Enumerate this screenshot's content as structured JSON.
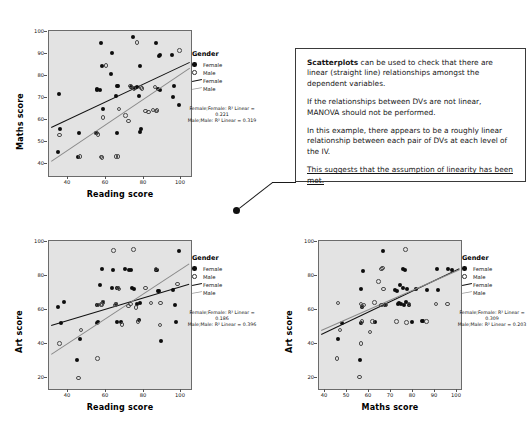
{
  "page": {
    "background": "#ffffff"
  },
  "colors": {
    "plot_background": "#e3e3e3",
    "plot_border": "#6b6b6b",
    "female_marker": "#0d0d0d",
    "male_marker": "#4a4a4a",
    "female_line": "#111111",
    "male_line": "#8a8a8a",
    "textbox_border": "#3a3a3a"
  },
  "legend": {
    "title": "Gender",
    "items": [
      {
        "label": "Female",
        "key": "filled-circle"
      },
      {
        "label": "Male",
        "key": "open-circle"
      },
      {
        "label": "Female",
        "key": "solid-line"
      },
      {
        "label": "Male",
        "key": "thin-line"
      }
    ]
  },
  "textbox": {
    "paragraphs": [
      {
        "bold_lead": "Scatterplots",
        "rest": " can be used to check that there are linear (straight line) relationships amongst the dependent variables."
      },
      {
        "bold_lead": "",
        "rest": "If the relationships between DVs are not linear, MANOVA should not be performed."
      },
      {
        "bold_lead": "",
        "rest": "In this example, there appears to be a roughly linear relationship between each pair of DVs at each level of the IV."
      }
    ],
    "underlined_paragraph": "This suggests that the assumption of linearity has been met."
  },
  "chart_data": [
    {
      "id": "maths-vs-reading",
      "type": "scatter",
      "title": "",
      "xlabel": "Reading score",
      "ylabel": "Maths score",
      "xlim": [
        30,
        105
      ],
      "ylim": [
        36,
        103
      ],
      "xticks": [
        40,
        60,
        80,
        100
      ],
      "yticks": [
        40,
        50,
        60,
        70,
        80,
        90,
        100
      ],
      "grid": false,
      "legend_position": "right",
      "r_squared_text": "Female;Female: R² Linear = 0.221\nMale;Male: R² Linear = 0.319",
      "series": [
        {
          "name": "Female",
          "marker": "filled-circle",
          "r_squared": 0.221,
          "fit": {
            "x1": 31,
            "y1": 58.6,
            "x2": 104,
            "y2": 88.6
          },
          "points": [
            [
              35.5,
              74.0
            ],
            [
              36.0,
              57.8
            ],
            [
              35.0,
              47.2
            ],
            [
              45.5,
              45.0
            ],
            [
              46.0,
              55.8
            ],
            [
              55.5,
              76.0
            ],
            [
              55.0,
              55.8
            ],
            [
              57.5,
              97.6
            ],
            [
              58.0,
              87.0
            ],
            [
              55.5,
              75.6
            ],
            [
              58.5,
              66.8
            ],
            [
              63.5,
              93.0
            ],
            [
              63.0,
              83.0
            ],
            [
              65.5,
              73.0
            ],
            [
              66.0,
              55.8
            ],
            [
              66.5,
              77.8
            ],
            [
              74.5,
              100.0
            ],
            [
              73.5,
              77.0
            ],
            [
              75.5,
              76.8
            ],
            [
              76.5,
              77.2
            ],
            [
              77.5,
              73.0
            ],
            [
              78.0,
              87.0
            ],
            [
              78.5,
              57.8
            ],
            [
              78.0,
              56.2
            ],
            [
              86.5,
              97.5
            ],
            [
              88.0,
              91.5
            ],
            [
              88.5,
              91.8
            ],
            [
              87.5,
              76.0
            ],
            [
              88.5,
              75.8
            ],
            [
              95.0,
              92.0
            ],
            [
              95.5,
              72.5
            ],
            [
              96.0,
              77.8
            ],
            [
              98.5,
              69.0
            ],
            [
              66.0,
              77.5
            ],
            [
              57.0,
              75.8
            ]
          ]
        },
        {
          "name": "Male",
          "marker": "open-circle",
          "r_squared": 0.319,
          "fit": {
            "x1": 31,
            "y1": 43.0,
            "x2": 104,
            "y2": 86.0
          },
          "points": [
            [
              35.5,
              55.0
            ],
            [
              46.5,
              45.0
            ],
            [
              55.0,
              55.8
            ],
            [
              56.0,
              55.2
            ],
            [
              57.5,
              44.8
            ],
            [
              58.0,
              44.6
            ],
            [
              58.5,
              63.0
            ],
            [
              60.0,
              87.0
            ],
            [
              65.5,
              45.0
            ],
            [
              66.5,
              45.0
            ],
            [
              67.0,
              67.0
            ],
            [
              70.5,
              64.0
            ],
            [
              72.0,
              61.5
            ],
            [
              76.5,
              97.6
            ],
            [
              78.5,
              77.0
            ],
            [
              79.0,
              76.5
            ],
            [
              81.0,
              66.0
            ],
            [
              82.5,
              65.5
            ],
            [
              85.0,
              66.5
            ],
            [
              86.0,
              77.2
            ],
            [
              99.0,
              94.0
            ],
            [
              86.5,
              66.0
            ],
            [
              87.0,
              66.2
            ],
            [
              75.0,
              76.5
            ],
            [
              73.0,
              77.5
            ]
          ]
        }
      ]
    },
    {
      "id": "art-vs-reading",
      "type": "scatter",
      "title": "",
      "xlabel": "Reading score",
      "ylabel": "Art score",
      "xlim": [
        30,
        105
      ],
      "ylim": [
        16,
        104
      ],
      "xticks": [
        40,
        60,
        80,
        100
      ],
      "yticks": [
        20,
        40,
        60,
        80,
        100
      ],
      "grid": false,
      "legend_position": "right",
      "r_squared_text": "Female;Female: R² Linear = 0.186\nMale;Male: R² Linear = 0.396",
      "series": [
        {
          "name": "Female",
          "marker": "filled-circle",
          "r_squared": 0.186,
          "fit": {
            "x1": 31,
            "y1": 54.0,
            "x2": 104,
            "y2": 78.5
          },
          "points": [
            [
              35.0,
              65.0
            ],
            [
              36.5,
              55.0
            ],
            [
              38.0,
              67.5
            ],
            [
              45.0,
              33.0
            ],
            [
              46.5,
              45.5
            ],
            [
              55.5,
              66.0
            ],
            [
              56.0,
              55.8
            ],
            [
              55.5,
              55.5
            ],
            [
              57.0,
              78.0
            ],
            [
              58.5,
              68.0
            ],
            [
              58.0,
              87.5
            ],
            [
              64.0,
              87.0
            ],
            [
              65.5,
              66.8
            ],
            [
              66.0,
              75.8
            ],
            [
              66.5,
              76.0
            ],
            [
              68.0,
              55.8
            ],
            [
              70.0,
              87.5
            ],
            [
              72.0,
              87.0
            ],
            [
              73.5,
              86.5
            ],
            [
              74.0,
              76.0
            ],
            [
              75.0,
              75.5
            ],
            [
              76.5,
              66.8
            ],
            [
              77.5,
              57.0
            ],
            [
              78.0,
              67.0
            ],
            [
              86.5,
              87.0
            ],
            [
              87.0,
              86.5
            ],
            [
              87.5,
              74.5
            ],
            [
              88.0,
              74.0
            ],
            [
              89.0,
              44.5
            ],
            [
              95.5,
              75.0
            ],
            [
              96.5,
              66.0
            ],
            [
              98.5,
              98.0
            ],
            [
              97.0,
              56.0
            ],
            [
              66.0,
              55.8
            ],
            [
              63.5,
              76.0
            ]
          ]
        },
        {
          "name": "Male",
          "marker": "open-circle",
          "r_squared": 0.396,
          "fit": {
            "x1": 31,
            "y1": 37.0,
            "x2": 104,
            "y2": 91.0
          },
          "points": [
            [
              35.5,
              43.0
            ],
            [
              45.5,
              22.5
            ],
            [
              47.0,
              51.0
            ],
            [
              55.5,
              34.0
            ],
            [
              56.0,
              66.0
            ],
            [
              57.5,
              66.3
            ],
            [
              58.5,
              67.5
            ],
            [
              64.0,
              98.5
            ],
            [
              65.5,
              66.5
            ],
            [
              66.5,
              76.0
            ],
            [
              67.0,
              75.5
            ],
            [
              68.5,
              54.5
            ],
            [
              72.0,
              65.5
            ],
            [
              73.0,
              66.5
            ],
            [
              74.5,
              99.0
            ],
            [
              76.0,
              64.5
            ],
            [
              77.0,
              56.0
            ],
            [
              81.0,
              76.0
            ],
            [
              84.0,
              67.0
            ],
            [
              86.5,
              87.5
            ],
            [
              88.5,
              54.0
            ],
            [
              89.0,
              67.0
            ],
            [
              98.0,
              78.5
            ],
            [
              58.0,
              66.2
            ],
            [
              65.0,
              66.0
            ]
          ]
        }
      ]
    },
    {
      "id": "art-vs-maths",
      "type": "scatter",
      "title": "",
      "xlabel": "Maths score",
      "ylabel": "Art score",
      "xlim": [
        36,
        104
      ],
      "ylim": [
        16,
        104
      ],
      "xticks": [
        40,
        50,
        60,
        70,
        80,
        90,
        100
      ],
      "yticks": [
        20,
        40,
        60,
        80,
        100
      ],
      "grid": false,
      "legend_position": "right",
      "r_squared_text": "Female;Female: R² Linear = 0.309\nMale;Male: R² Linear = 0.203",
      "series": [
        {
          "name": "Female",
          "marker": "filled-circle",
          "r_squared": 0.309,
          "fit": {
            "x1": 37,
            "y1": 49.0,
            "x2": 103,
            "y2": 88.0
          },
          "points": [
            [
              45.0,
              45.5
            ],
            [
              47.0,
              55.0
            ],
            [
              55.5,
              33.0
            ],
            [
              56.0,
              55.5
            ],
            [
              56.5,
              65.0
            ],
            [
              56.0,
              75.5
            ],
            [
              57.0,
              86.0
            ],
            [
              63.0,
              56.0
            ],
            [
              66.5,
              98.0
            ],
            [
              67.5,
              66.0
            ],
            [
              72.5,
              75.0
            ],
            [
              73.5,
              74.5
            ],
            [
              74.5,
              67.0
            ],
            [
              75.0,
              78.0
            ],
            [
              75.5,
              66.5
            ],
            [
              76.0,
              87.5
            ],
            [
              76.5,
              66.0
            ],
            [
              77.0,
              87.0
            ],
            [
              77.5,
              67.5
            ],
            [
              78.0,
              75.5
            ],
            [
              79.0,
              66.0
            ],
            [
              80.5,
              56.0
            ],
            [
              82.5,
              75.5
            ],
            [
              85.5,
              56.5
            ],
            [
              86.0,
              56.2
            ],
            [
              87.5,
              75.0
            ],
            [
              92.5,
              87.5
            ],
            [
              93.0,
              75.0
            ],
            [
              98.0,
              87.5
            ],
            [
              99.5,
              87.0
            ],
            [
              74.0,
              66.5
            ],
            [
              76.0,
              76.0
            ]
          ]
        },
        {
          "name": "Male",
          "marker": "open-circle",
          "r_squared": 0.203,
          "fit": {
            "x1": 37,
            "y1": 51.0,
            "x2": 103,
            "y2": 87.0
          },
          "points": [
            [
              44.5,
              34.0
            ],
            [
              45.0,
              67.0
            ],
            [
              46.0,
              51.0
            ],
            [
              55.5,
              23.0
            ],
            [
              56.0,
              43.0
            ],
            [
              56.5,
              65.5
            ],
            [
              56.0,
              66.5
            ],
            [
              57.5,
              66.0
            ],
            [
              60.5,
              50.0
            ],
            [
              61.5,
              56.0
            ],
            [
              62.5,
              67.5
            ],
            [
              64.5,
              80.0
            ],
            [
              66.0,
              87.5
            ],
            [
              66.5,
              88.0
            ],
            [
              67.0,
              75.5
            ],
            [
              68.0,
              66.0
            ],
            [
              73.0,
              56.0
            ],
            [
              77.5,
              99.0
            ],
            [
              78.0,
              55.5
            ],
            [
              79.0,
              66.5
            ],
            [
              87.5,
              56.0
            ],
            [
              92.0,
              66.5
            ],
            [
              97.5,
              66.5
            ],
            [
              66.0,
              66.0
            ],
            [
              56.5,
              56.0
            ]
          ]
        }
      ]
    }
  ]
}
